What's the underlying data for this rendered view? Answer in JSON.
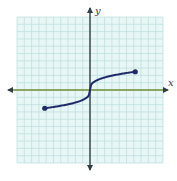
{
  "chart_data": {
    "type": "line",
    "title": "",
    "xlabel": "x",
    "ylabel": "y",
    "xlim": [
      -10,
      10
    ],
    "ylim": [
      -10,
      10
    ],
    "grid": true,
    "legend": null,
    "series": [
      {
        "name": "curve",
        "shape": "cube-root-like increasing curve through origin",
        "x": [
          -6.2,
          -4,
          -2,
          -1,
          -0.3,
          0,
          0.3,
          1,
          2,
          4,
          6.2
        ],
        "y": [
          -2.5,
          -2.15,
          -1.7,
          -1.3,
          -0.8,
          0,
          0.8,
          1.3,
          1.7,
          2.15,
          2.5
        ],
        "endpoints": [
          {
            "x": -6.2,
            "y": -2.5,
            "closed": true
          },
          {
            "x": 6.2,
            "y": 2.5,
            "closed": true
          }
        ]
      }
    ]
  },
  "axes": {
    "x_label": "x",
    "y_label": "y"
  },
  "colors": {
    "grid_bg": "#e8f6f6",
    "grid_line": "#b9dedd",
    "x_axis": "#6f8f33",
    "y_axis": "#2f3f45",
    "curve": "#1f2a6b"
  }
}
